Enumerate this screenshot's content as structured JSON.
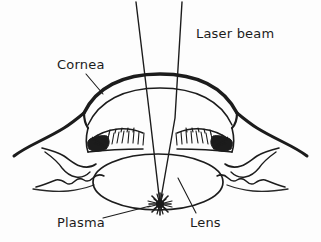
{
  "figure": {
    "background_color": "#fdfdfd",
    "ink_color": "#1c1c1c",
    "width": 321,
    "height": 242
  },
  "labels": {
    "laser_beam": "Laser beam",
    "cornea": "Cornea",
    "plasma": "Plasma",
    "lens": "Lens"
  },
  "anatomy": {
    "cornea_name": "cornea-arc",
    "anterior_chamber_name": "anterior-chamber",
    "iris_name": "iris",
    "ciliary_body_name": "ciliary-body",
    "lens_name": "crystalline-lens",
    "sclera_name": "sclera-conjunctiva",
    "plasma_name": "plasma-spark"
  },
  "beam": {
    "left_ray_top_x": 136,
    "right_ray_top_x": 182,
    "focus_x": 160,
    "focus_y": 204,
    "ray_count": 2
  }
}
